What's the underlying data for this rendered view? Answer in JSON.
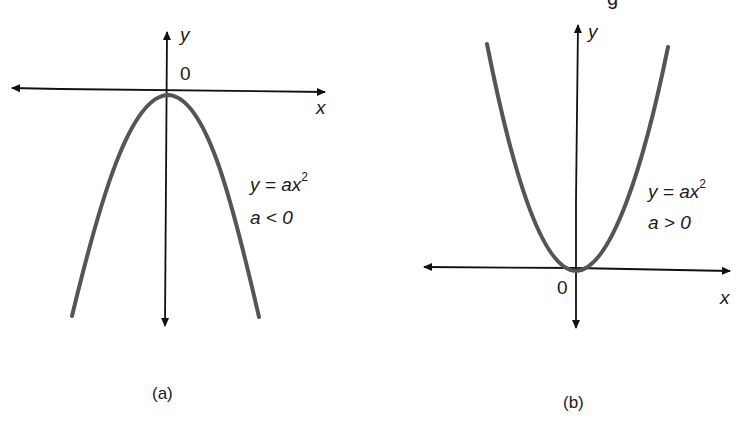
{
  "panel_a": {
    "caption": "(a)",
    "y_axis_label": "y",
    "x_axis_label": "x",
    "origin_label": "0",
    "equation": "y = ax",
    "exponent": "2",
    "condition": "a < 0",
    "curve_color": "#555555"
  },
  "panel_b": {
    "caption": "(b)",
    "y_axis_label": "y",
    "x_axis_label": "x",
    "origin_label": "0",
    "equation": "y = ax",
    "exponent": "2",
    "condition": "a > 0",
    "curve_color": "#555555"
  },
  "top_right_fragment": "g"
}
